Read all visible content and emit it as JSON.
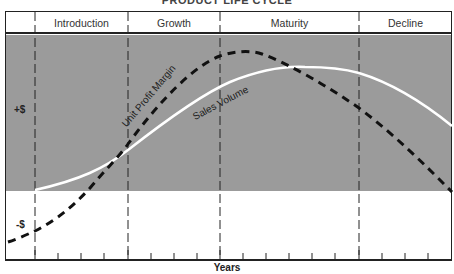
{
  "title": "PRODUCT LIFE CYCLE",
  "stages": [
    {
      "label": "Introduction",
      "x_start": 35,
      "x_end": 128
    },
    {
      "label": "Growth",
      "x_start": 128,
      "x_end": 220
    },
    {
      "label": "Maturity",
      "x_start": 220,
      "x_end": 359
    },
    {
      "label": "Decline",
      "x_start": 359,
      "x_end": 452
    }
  ],
  "y_axis": {
    "positive_label": "+$",
    "negative_label": "-$"
  },
  "x_axis": {
    "label": "Years"
  },
  "curves": {
    "profit": {
      "label": "Unit Profit Margin",
      "style": "dashed",
      "color": "#111111"
    },
    "sales": {
      "label": "Sales Volume",
      "style": "solid",
      "color": "#ffffff"
    }
  },
  "colors": {
    "positive_zone": "#9b9b9b",
    "negative_zone": "#ffffff",
    "lines": "#222222"
  }
}
